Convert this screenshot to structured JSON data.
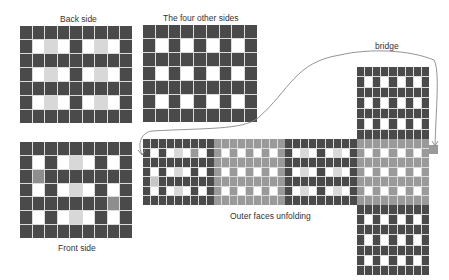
{
  "labels": {
    "back_side": "Back side",
    "four_other_sides": "The four other sides",
    "front_side": "Front side",
    "outer_faces_unfolding": "Outer faces unfolding",
    "bridge": "bridge"
  },
  "colors": {
    "dark": "#4a4a4a",
    "white": "#ffffff",
    "light_grey": "#d8d8d8",
    "mid_grey": "#8e8e8e",
    "grey_face": "#9a9a9a",
    "grey_face_light": "#c6c6c6",
    "grid_line": "#dcdcdc",
    "curve": "#888888"
  },
  "grids": {
    "back_side": {
      "x": 20,
      "y": 26,
      "w": 112,
      "h": 97,
      "cols": 9,
      "rows": [
        [
          1,
          1,
          1,
          1,
          1,
          1,
          1,
          1,
          1
        ],
        [
          1,
          0,
          2,
          0,
          1,
          0,
          2,
          0,
          1
        ],
        [
          1,
          1,
          1,
          1,
          1,
          1,
          1,
          1,
          1
        ],
        [
          1,
          0,
          2,
          0,
          1,
          0,
          2,
          0,
          1
        ],
        [
          1,
          1,
          1,
          1,
          1,
          1,
          1,
          1,
          1
        ],
        [
          1,
          0,
          2,
          0,
          1,
          0,
          2,
          0,
          1
        ],
        [
          1,
          1,
          1,
          1,
          1,
          1,
          1,
          1,
          1
        ]
      ]
    },
    "four_other_sides": {
      "x": 143,
      "y": 25,
      "w": 114,
      "h": 97,
      "cols": 9,
      "rows": [
        [
          1,
          1,
          1,
          1,
          1,
          1,
          1,
          1,
          1
        ],
        [
          1,
          0,
          1,
          0,
          1,
          0,
          1,
          0,
          1
        ],
        [
          1,
          1,
          1,
          1,
          1,
          1,
          1,
          1,
          1
        ],
        [
          1,
          0,
          1,
          0,
          1,
          0,
          1,
          0,
          1
        ],
        [
          1,
          1,
          1,
          1,
          1,
          1,
          1,
          1,
          1
        ],
        [
          1,
          0,
          1,
          0,
          1,
          0,
          1,
          0,
          1
        ],
        [
          1,
          1,
          1,
          1,
          1,
          1,
          1,
          1,
          1
        ]
      ]
    },
    "front_side": {
      "x": 20,
      "y": 142,
      "w": 112,
      "h": 96,
      "cols": 9,
      "rows": [
        [
          1,
          1,
          1,
          1,
          1,
          1,
          1,
          1,
          1
        ],
        [
          1,
          0,
          1,
          0,
          2,
          0,
          1,
          0,
          1
        ],
        [
          1,
          3,
          1,
          1,
          1,
          1,
          1,
          1,
          1
        ],
        [
          1,
          0,
          1,
          0,
          2,
          0,
          1,
          0,
          1
        ],
        [
          1,
          1,
          1,
          1,
          1,
          1,
          1,
          3,
          1
        ],
        [
          1,
          0,
          1,
          0,
          2,
          0,
          1,
          0,
          1
        ],
        [
          1,
          1,
          1,
          1,
          1,
          1,
          1,
          1,
          1
        ]
      ]
    },
    "strip_face_1": {
      "x": 143,
      "y": 139,
      "w": 71,
      "h": 66,
      "cols": 9,
      "rows": [
        [
          1,
          1,
          1,
          1,
          1,
          1,
          1,
          1,
          1
        ],
        [
          1,
          0,
          1,
          0,
          2,
          0,
          4,
          0,
          1
        ],
        [
          1,
          1,
          1,
          1,
          1,
          1,
          1,
          1,
          1
        ],
        [
          1,
          0,
          1,
          0,
          2,
          0,
          1,
          0,
          1
        ],
        [
          1,
          5,
          1,
          1,
          1,
          1,
          1,
          1,
          1
        ],
        [
          1,
          0,
          1,
          0,
          2,
          0,
          1,
          0,
          1
        ],
        [
          1,
          1,
          1,
          1,
          1,
          1,
          1,
          1,
          1
        ]
      ]
    },
    "strip_face_2": {
      "x": 214,
      "y": 139,
      "w": 71,
      "h": 66,
      "cols": 9,
      "rows": [
        [
          4,
          4,
          4,
          4,
          4,
          4,
          4,
          4,
          4
        ],
        [
          4,
          0,
          4,
          0,
          4,
          0,
          4,
          0,
          4
        ],
        [
          4,
          4,
          4,
          4,
          4,
          4,
          4,
          4,
          4
        ],
        [
          4,
          0,
          4,
          0,
          4,
          0,
          4,
          0,
          4
        ],
        [
          4,
          4,
          4,
          4,
          4,
          4,
          4,
          4,
          4
        ],
        [
          4,
          0,
          4,
          0,
          4,
          0,
          4,
          0,
          4
        ],
        [
          4,
          4,
          4,
          4,
          4,
          4,
          4,
          4,
          4
        ]
      ]
    },
    "strip_face_3": {
      "x": 285,
      "y": 139,
      "w": 72,
      "h": 66,
      "cols": 9,
      "rows": [
        [
          1,
          1,
          1,
          1,
          1,
          1,
          1,
          1,
          1
        ],
        [
          1,
          0,
          2,
          0,
          1,
          0,
          2,
          0,
          1
        ],
        [
          1,
          1,
          1,
          1,
          1,
          1,
          1,
          1,
          1
        ],
        [
          1,
          0,
          2,
          0,
          1,
          0,
          2,
          0,
          1
        ],
        [
          1,
          1,
          1,
          1,
          1,
          1,
          1,
          1,
          1
        ],
        [
          1,
          0,
          2,
          0,
          1,
          0,
          2,
          0,
          1
        ],
        [
          1,
          1,
          1,
          1,
          1,
          1,
          1,
          1,
          1
        ]
      ]
    },
    "strip_face_4": {
      "x": 357,
      "y": 139,
      "w": 72,
      "h": 66,
      "cols": 9,
      "rows": [
        [
          4,
          4,
          4,
          4,
          4,
          4,
          4,
          4,
          4
        ],
        [
          4,
          0,
          4,
          0,
          4,
          0,
          4,
          0,
          4
        ],
        [
          4,
          4,
          4,
          4,
          4,
          4,
          4,
          4,
          4
        ],
        [
          4,
          0,
          4,
          0,
          4,
          0,
          4,
          0,
          4
        ],
        [
          4,
          4,
          4,
          4,
          4,
          4,
          4,
          4,
          4
        ],
        [
          4,
          0,
          4,
          0,
          4,
          0,
          4,
          0,
          4
        ],
        [
          4,
          4,
          4,
          4,
          4,
          4,
          4,
          4,
          4
        ]
      ]
    },
    "bridge_cell": {
      "x": 429,
      "y": 145,
      "w": 9,
      "h": 9,
      "cols": 1,
      "rows": [
        [
          4
        ]
      ]
    },
    "top_face": {
      "x": 357,
      "y": 67,
      "w": 72,
      "h": 72,
      "cols": 9,
      "rows": [
        [
          1,
          1,
          1,
          1,
          1,
          1,
          1,
          1,
          1
        ],
        [
          1,
          0,
          1,
          0,
          1,
          0,
          1,
          0,
          1
        ],
        [
          1,
          1,
          1,
          1,
          1,
          1,
          1,
          1,
          1
        ],
        [
          1,
          0,
          1,
          0,
          1,
          0,
          1,
          0,
          1
        ],
        [
          1,
          1,
          1,
          1,
          1,
          1,
          1,
          1,
          1
        ],
        [
          1,
          0,
          1,
          0,
          1,
          0,
          1,
          0,
          1
        ],
        [
          1,
          1,
          1,
          1,
          1,
          1,
          1,
          1,
          1
        ]
      ]
    },
    "bottom_face": {
      "x": 357,
      "y": 205,
      "w": 72,
      "h": 70,
      "cols": 9,
      "rows": [
        [
          1,
          1,
          1,
          1,
          1,
          1,
          1,
          1,
          1
        ],
        [
          1,
          0,
          1,
          0,
          1,
          0,
          1,
          0,
          1
        ],
        [
          1,
          1,
          1,
          1,
          1,
          1,
          1,
          1,
          1
        ],
        [
          1,
          0,
          1,
          0,
          1,
          0,
          1,
          0,
          1
        ],
        [
          1,
          1,
          1,
          1,
          1,
          1,
          1,
          1,
          1
        ],
        [
          1,
          0,
          1,
          0,
          1,
          0,
          1,
          0,
          1
        ],
        [
          1,
          1,
          1,
          1,
          1,
          1,
          1,
          1,
          1
        ]
      ]
    }
  }
}
